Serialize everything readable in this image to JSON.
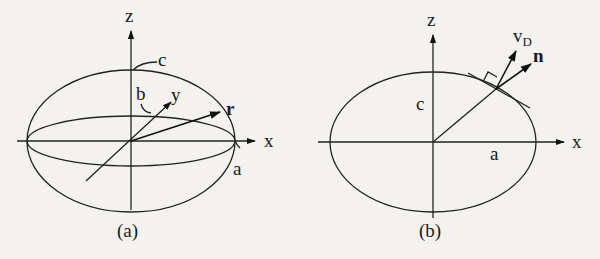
{
  "figure": {
    "panels": [
      {
        "id": "a",
        "caption": "(a)",
        "labels": {
          "z_axis": "z",
          "x_axis": "x",
          "y_axis": "y",
          "semi_axis_a": "a",
          "semi_axis_b": "b",
          "semi_axis_c": "c",
          "position_vector": "r"
        }
      },
      {
        "id": "b",
        "caption": "(b)",
        "labels": {
          "z_axis": "z",
          "x_axis": "x",
          "semi_axis_a": "a",
          "semi_axis_c": "c",
          "velocity_vector": "v",
          "velocity_subscript": "D",
          "normal_vector": "n"
        }
      }
    ],
    "colors": {
      "background": "#f4f2ee",
      "ink": "#1a1a1a"
    }
  }
}
